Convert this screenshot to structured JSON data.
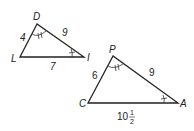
{
  "triangles": [
    {
      "name": "DLI",
      "vertices": {
        "top": "D",
        "left": "L",
        "right": "I"
      },
      "sides": {
        "DL": "4",
        "DI": "9",
        "LI": "7"
      },
      "angle_marks": {
        "D": "double",
        "I": "single"
      }
    },
    {
      "name": "PCA",
      "vertices": {
        "top": "P",
        "left": "C",
        "right": "A"
      },
      "sides": {
        "PC": "6",
        "PA": "9",
        "CA_whole": "10",
        "CA_num": "1",
        "CA_den": "2"
      },
      "angle_marks": {
        "P": "double",
        "A": "single"
      }
    }
  ],
  "colors": {
    "stroke": "#222222",
    "background": "#ffffff"
  }
}
